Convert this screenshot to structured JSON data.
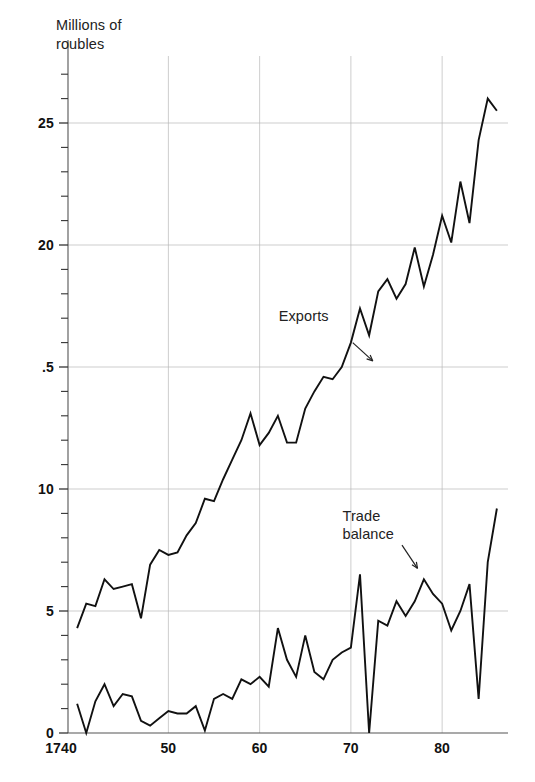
{
  "figure": {
    "axis_title": "Millions of\nroubles",
    "background": "#ffffff",
    "line_color": "#111111",
    "grid_color": "#b8b8b8",
    "axis_color": "#555555"
  },
  "annotations": {
    "exports": {
      "label": "Exports",
      "x": 1769,
      "y": 16.4
    },
    "trade_balance": {
      "label": "Trade\nbalance",
      "x": 1775,
      "y": 8.3
    }
  },
  "chart_data": {
    "type": "line",
    "title": "",
    "subtitle": "",
    "xlabel": "",
    "ylabel": "Millions of roubles",
    "xlim": [
      1739,
      1787
    ],
    "ylim": [
      0,
      27.5
    ],
    "grid": true,
    "grid_x": [
      1750,
      1760,
      1770,
      1780
    ],
    "grid_y": [
      5,
      10,
      15,
      20,
      25
    ],
    "xticks": [
      1740,
      1750,
      1760,
      1770,
      1780
    ],
    "xtick_labels": [
      "1740",
      "50",
      "60",
      "70",
      "80"
    ],
    "yticks": [
      0,
      5,
      10,
      15,
      20,
      25
    ],
    "ytick_labels": [
      "0",
      "5",
      "10",
      ".5",
      "20",
      "25"
    ],
    "yminor_step": 1,
    "legend": "annotated-inline",
    "legend_position": "inline",
    "series": [
      {
        "name": "Exports",
        "x": [
          1740,
          1741,
          1742,
          1743,
          1744,
          1745,
          1746,
          1747,
          1748,
          1749,
          1750,
          1751,
          1752,
          1753,
          1754,
          1755,
          1756,
          1757,
          1758,
          1759,
          1760,
          1761,
          1762,
          1763,
          1764,
          1765,
          1766,
          1767,
          1768,
          1769,
          1770,
          1771,
          1772,
          1773,
          1774,
          1775,
          1776,
          1777,
          1778,
          1779,
          1780,
          1781,
          1782,
          1783,
          1784,
          1785,
          1786
        ],
        "values": [
          4.3,
          5.3,
          5.2,
          6.3,
          5.9,
          6.0,
          6.1,
          4.7,
          6.9,
          7.5,
          7.3,
          7.4,
          8.1,
          8.6,
          9.6,
          9.5,
          10.4,
          11.2,
          12.0,
          13.1,
          11.8,
          12.3,
          13.0,
          11.9,
          11.9,
          13.3,
          14.0,
          14.6,
          14.5,
          15.0,
          16.0,
          17.4,
          16.3,
          18.1,
          18.6,
          17.8,
          18.4,
          19.9,
          18.3,
          19.6,
          21.2,
          20.1,
          22.6,
          20.9,
          24.3,
          26.0,
          25.5
        ]
      },
      {
        "name": "Trade balance",
        "x": [
          1740,
          1741,
          1742,
          1743,
          1744,
          1745,
          1746,
          1747,
          1748,
          1749,
          1750,
          1751,
          1752,
          1753,
          1754,
          1755,
          1756,
          1757,
          1758,
          1759,
          1760,
          1761,
          1762,
          1763,
          1764,
          1765,
          1766,
          1767,
          1768,
          1769,
          1770,
          1771,
          1772,
          1773,
          1774,
          1775,
          1776,
          1777,
          1778,
          1779,
          1780,
          1781,
          1782,
          1783,
          1784,
          1785,
          1786
        ],
        "values": [
          1.2,
          0.0,
          1.3,
          2.0,
          1.1,
          1.6,
          1.5,
          0.5,
          0.3,
          0.6,
          0.9,
          0.8,
          0.8,
          1.1,
          0.1,
          1.4,
          1.6,
          1.4,
          2.2,
          2.0,
          2.3,
          1.9,
          4.3,
          3.0,
          2.3,
          4.0,
          2.5,
          2.2,
          3.0,
          3.3,
          3.5,
          6.5,
          0.0,
          4.6,
          4.4,
          5.4,
          4.8,
          5.4,
          6.3,
          5.7,
          5.3,
          4.2,
          5.0,
          6.1,
          1.4,
          7.0,
          9.2
        ]
      }
    ]
  }
}
